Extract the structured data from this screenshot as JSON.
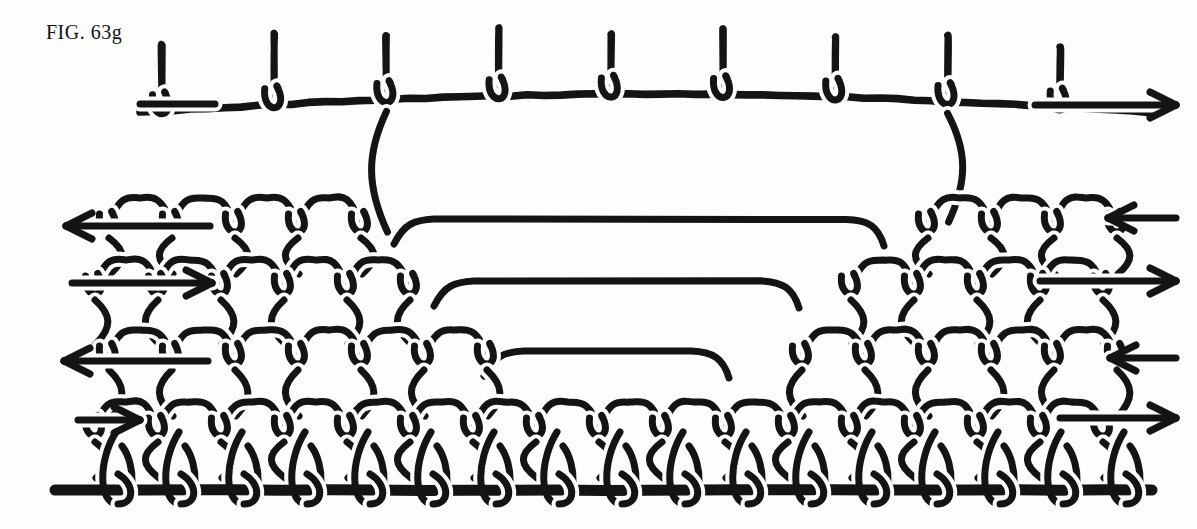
{
  "figure": {
    "caption": "FIG. 63g",
    "caption_x": 46,
    "caption_y": 21,
    "background_color": "#fdfdfc",
    "ink_color": "#141414",
    "canvas": {
      "width": 1197,
      "height": 529
    }
  },
  "style": {
    "thread_width": 7,
    "thick_cord_width": 11,
    "halo_width": 15,
    "arrow_width": 7,
    "arrow_head_length": 26,
    "arrow_head_spread": 13
  },
  "foundation_cord": {
    "name": "foundation-cord",
    "y": 490,
    "x_start": 55,
    "x_end": 1152,
    "stroke_width": 11,
    "description": "heavy straight starting cord at base of fabric"
  },
  "arrows": [
    {
      "id": "arrow-row-1",
      "label": "row 1 working direction",
      "direction": "right",
      "y": 105,
      "x_tail": 1035,
      "x_head": 1176
    },
    {
      "id": "arrow-row-2",
      "label": "row 2 working direction",
      "direction": "left",
      "y": 226,
      "x_tail": 210,
      "x_head": 66
    },
    {
      "id": "arrow-row-2r",
      "label": "row 2 return direction",
      "direction": "left",
      "y": 218,
      "x_tail": 1176,
      "x_head": 1108
    },
    {
      "id": "arrow-row-3",
      "label": "row 3 working direction",
      "direction": "right",
      "y": 283,
      "x_tail": 72,
      "x_head": 212
    },
    {
      "id": "arrow-row-3r",
      "label": "row 3 return direction",
      "direction": "right",
      "y": 281,
      "x_tail": 1040,
      "x_head": 1176
    },
    {
      "id": "arrow-row-4",
      "label": "row 4 working direction",
      "direction": "left",
      "y": 361,
      "x_tail": 208,
      "x_head": 64
    },
    {
      "id": "arrow-row-4r",
      "label": "row 4 return direction",
      "direction": "left",
      "y": 358,
      "x_tail": 1176,
      "x_head": 1110
    },
    {
      "id": "arrow-row-5",
      "label": "row 5 working direction",
      "direction": "right",
      "y": 420,
      "x_tail": 78,
      "x_head": 140
    },
    {
      "id": "arrow-row-5r",
      "label": "row 5 return direction",
      "direction": "right",
      "y": 418,
      "x_tail": 1060,
      "x_head": 1176
    }
  ],
  "rows": [
    {
      "id": "row-top-arches",
      "label": "top row of arched loops",
      "baseline_y": 112,
      "arc_rise": 18,
      "loop_count": 9,
      "x_start": 140,
      "x_end": 1150,
      "arch_height": 62,
      "note": "wide arches rising above a gently curved working thread"
    },
    {
      "id": "row-2",
      "label": "second row with central open span",
      "baseline_y": 228,
      "gap_x_start": 400,
      "gap_x_end": 880,
      "loop_count": 10
    },
    {
      "id": "row-3",
      "label": "third row with central open span",
      "baseline_y": 290,
      "gap_x_start": 440,
      "gap_x_end": 795,
      "loop_count": 12
    },
    {
      "id": "row-4",
      "label": "fourth row with central open span",
      "baseline_y": 360,
      "gap_x_start": 490,
      "gap_x_end": 725,
      "loop_count": 14
    },
    {
      "id": "row-5",
      "label": "bottom row worked onto foundation cord",
      "baseline_y": 432,
      "gap_x_start": 0,
      "gap_x_end": 0,
      "loop_count": 15
    }
  ],
  "legend_note": "Loops interlock in a descending mesh; short central rows create the shaped opening."
}
